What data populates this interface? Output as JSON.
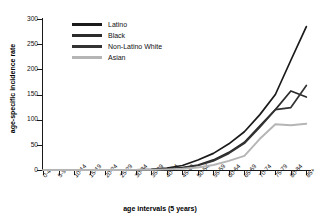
{
  "chart_data": {
    "type": "line",
    "title": "",
    "xlabel": "age intervals (5 years)",
    "ylabel": "age-specific incidence rate",
    "ylim": [
      0,
      300
    ],
    "yticks": [
      0,
      50,
      100,
      150,
      200,
      250,
      300
    ],
    "grid": false,
    "legend_position": "top-left inside plot",
    "categories": [
      "0-4",
      "5-9",
      "10-14",
      "15-19",
      "20-24",
      "25-29",
      "30-34",
      "35-39",
      "40-44",
      "45-49",
      "50-54",
      "55-59",
      "60-64",
      "65-69",
      "70-74",
      "75-79",
      "80-84",
      "85+"
    ],
    "series": [
      {
        "name": "Latino",
        "color": "#1a1a1a",
        "values": [
          0,
          0,
          0,
          0,
          0,
          0,
          0.5,
          1.5,
          4,
          9,
          20,
          33,
          52,
          76,
          110,
          150,
          218,
          285
        ]
      },
      {
        "name": "Black",
        "color": "#2b2b2b",
        "values": [
          0,
          0,
          0,
          0,
          0,
          0,
          0.4,
          1,
          2.5,
          5,
          10,
          20,
          35,
          55,
          88,
          120,
          157,
          145
        ]
      },
      {
        "name": "Non-Latino White",
        "color": "#333333",
        "values": [
          0,
          0,
          0,
          0,
          0,
          0,
          0.3,
          0.8,
          2,
          4.5,
          9,
          18,
          33,
          53,
          85,
          120,
          124,
          168
        ]
      },
      {
        "name": "Asian",
        "color": "#b5b5b5",
        "values": [
          0,
          0,
          0,
          0,
          0,
          0,
          0.2,
          0.5,
          1.2,
          2.5,
          5,
          10,
          18,
          28,
          62,
          91,
          89,
          92
        ]
      }
    ]
  },
  "legend": {
    "items": [
      {
        "label": "Latino"
      },
      {
        "label": "Black"
      },
      {
        "label": "Non-Latino White"
      },
      {
        "label": "Asian"
      }
    ]
  },
  "axes": {
    "y_title": "age-specific incidence rate",
    "x_title": "age intervals (5 years)",
    "y_tick_labels": [
      "300",
      "250",
      "200",
      "150",
      "100",
      "50",
      "0"
    ]
  }
}
